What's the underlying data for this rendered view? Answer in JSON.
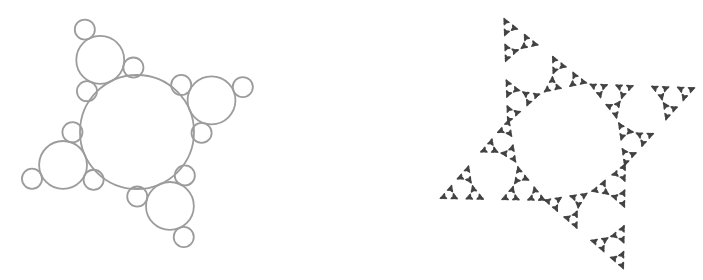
{
  "canvas": {
    "width": 703,
    "height": 280,
    "background": "#ffffff"
  },
  "figure": {
    "generator": {
      "root_angles_deg": [
        23,
        117,
        204,
        294
      ],
      "child_angle_offsets_deg": [
        0,
        130,
        -130
      ],
      "radius_ratio": 0.42
    },
    "left_panel": {
      "name": "tangent-circles-fractal",
      "style": "outlined-circles",
      "center": {
        "x": 137,
        "y": 132
      },
      "root_radius": 57,
      "max_depth": 2,
      "stroke_color": "#9c9c9c",
      "stroke_width": 1.8,
      "fill": "none"
    },
    "right_panel": {
      "name": "triskelion-blob-fractal",
      "style": "filled-blobs",
      "center": {
        "x": 567,
        "y": 142
      },
      "root_radius": 57,
      "max_depth": 6,
      "fill_color": "#424242",
      "blob_radii_px": {
        "4": 2.1,
        "5": 1.15,
        "6": 0.62
      }
    }
  }
}
